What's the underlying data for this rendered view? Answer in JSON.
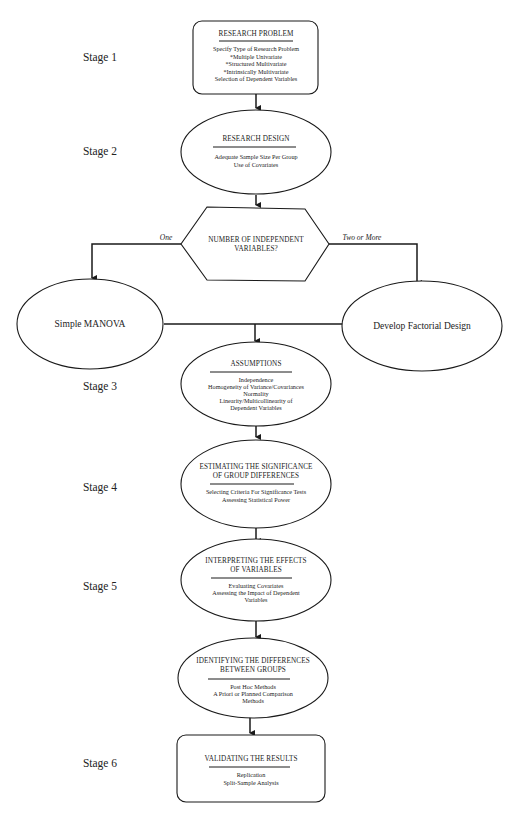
{
  "stages": [
    {
      "label": "Stage 1"
    },
    {
      "label": "Stage 2"
    },
    {
      "label": "Stage 3"
    },
    {
      "label": "Stage 4"
    },
    {
      "label": "Stage 5"
    },
    {
      "label": "Stage 6"
    }
  ],
  "nodes": {
    "research_problem": {
      "title": "RESEARCH PROBLEM",
      "items": [
        "Specify Type of Research Problem",
        "*Multiple Univariate",
        "*Structured Multivariate",
        "*Intrinsically Multivariate",
        "Selection of Dependent Variables"
      ]
    },
    "research_design": {
      "title": "RESEARCH DESIGN",
      "items": [
        "Adequate Sample Size Per Group",
        "Use of Covariates"
      ]
    },
    "decision": {
      "title_lines": [
        "NUMBER OF INDEPENDENT",
        "VARIABLES?"
      ],
      "left_branch": "One",
      "right_branch": "Two or More"
    },
    "simple_manova": {
      "title": "Simple MANOVA"
    },
    "factorial_design": {
      "title": "Develop Factorial Design"
    },
    "assumptions": {
      "title": "ASSUMPTIONS",
      "items": [
        "Independence",
        "Homogeneity of Variance/Covariances",
        "Normality",
        "Linearity/Multicollinearity of",
        "Dependent Variables"
      ]
    },
    "significance": {
      "title_lines": [
        "ESTIMATING THE SIGNIFICANCE",
        "OF GROUP DIFFERENCES"
      ],
      "items": [
        "Selecting Criteria For Significance Tests",
        "Assessing Statistical Power"
      ]
    },
    "interpreting": {
      "title_lines": [
        "INTERPRETING THE EFFECTS",
        "OF VARIABLES"
      ],
      "items": [
        "Evaluating Covariates",
        "Assessing the Impact of Dependent",
        "Variables"
      ]
    },
    "identifying": {
      "title_lines": [
        "IDENTIFYING THE DIFFERENCES",
        "BETWEEN GROUPS"
      ],
      "items": [
        "Post Hoc Methods",
        "A Priori or Planned Comparison",
        "Methods"
      ]
    },
    "validating": {
      "title": "VALIDATING THE RESULTS",
      "items": [
        "Replication",
        "Split-Sample Analysis"
      ]
    }
  }
}
